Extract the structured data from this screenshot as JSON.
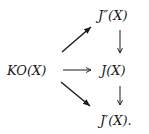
{
  "diagram": {
    "type": "commutative-diagram",
    "nodes": {
      "source": "KO(X)",
      "top": "J″(X)",
      "middle": "J(X)",
      "bottom": "J′(X)."
    },
    "edges": [
      {
        "from": "KO(X)",
        "to": "J″(X)",
        "direction": "diagonal-up"
      },
      {
        "from": "KO(X)",
        "to": "J(X)",
        "direction": "horizontal"
      },
      {
        "from": "KO(X)",
        "to": "J′(X)",
        "direction": "diagonal-down"
      },
      {
        "from": "J″(X)",
        "to": "J(X)",
        "direction": "vertical-down"
      },
      {
        "from": "J(X)",
        "to": "J′(X)",
        "direction": "vertical-down"
      }
    ],
    "colors": {
      "ink": "#1a1a1a",
      "background": "#ffffff"
    }
  }
}
